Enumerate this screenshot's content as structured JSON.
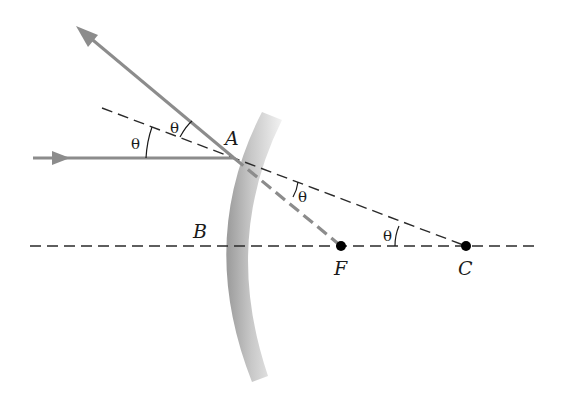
{
  "diagram": {
    "points": {
      "A": {
        "label": "A",
        "x": 234,
        "y": 158
      },
      "B": {
        "label": "B",
        "x": 222,
        "y": 246
      },
      "F": {
        "label": "F",
        "x": 341,
        "y": 246
      },
      "C": {
        "label": "C",
        "x": 466,
        "y": 246
      }
    },
    "angle_labels": {
      "incident": "θ",
      "reflected": "θ",
      "at_A_to_F": "θ",
      "at_C": "θ"
    },
    "colors": {
      "ray": "#8c8c8c",
      "dashed_line": "#2a2a2a",
      "mirror_light": "#e6e6e6",
      "mirror_dark": "#9a9a9a",
      "point": "#000000"
    },
    "elements": [
      "incident-ray",
      "reflected-ray",
      "normal-line-through-C",
      "principal-axis",
      "ray-A-to-F",
      "concave-mirror"
    ]
  }
}
